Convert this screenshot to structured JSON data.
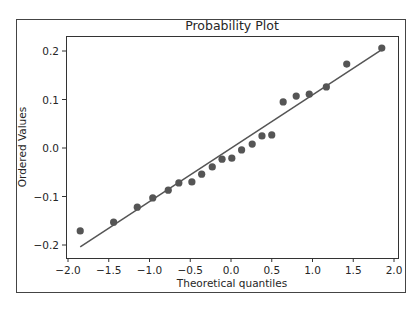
{
  "chart_data": {
    "type": "scatter",
    "title": "Probability Plot",
    "xlabel": "Theoretical quantiles",
    "ylabel": "Ordered Values",
    "xlim": [
      -2.02,
      2.05
    ],
    "ylim": [
      -0.227,
      0.231
    ],
    "grid": false,
    "legend": null,
    "x_ticks": [
      -2.0,
      -1.5,
      -1.0,
      -0.5,
      0.0,
      0.5,
      1.0,
      1.5,
      2.0
    ],
    "x_tick_labels": [
      "−2.0",
      "−1.5",
      "−1.0",
      "−0.5",
      "0.0",
      "0.5",
      "1.0",
      "1.5",
      "2.0"
    ],
    "y_ticks": [
      -0.2,
      -0.1,
      0.0,
      0.1,
      0.2
    ],
    "y_tick_labels": [
      "−0.2",
      "−0.1",
      "0.0",
      "0.1",
      "0.2"
    ],
    "series": [
      {
        "name": "ordered values",
        "kind": "scatter",
        "color": "#555555",
        "x": [
          -1.85,
          -1.44,
          -1.15,
          -0.96,
          -0.77,
          -0.64,
          -0.48,
          -0.36,
          -0.23,
          -0.11,
          0.01,
          0.13,
          0.26,
          0.38,
          0.5,
          0.64,
          0.8,
          0.96,
          1.17,
          1.42,
          1.85
        ],
        "y": [
          -0.171,
          -0.153,
          -0.122,
          -0.103,
          -0.087,
          -0.072,
          -0.07,
          -0.054,
          -0.039,
          -0.023,
          -0.021,
          -0.004,
          0.008,
          0.025,
          0.027,
          0.095,
          0.107,
          0.111,
          0.126,
          0.173,
          0.206
        ]
      },
      {
        "name": "fit line",
        "kind": "line",
        "color": "#555555",
        "x": [
          -1.85,
          1.85
        ],
        "y": [
          -0.204,
          0.203
        ]
      }
    ]
  },
  "layout": {
    "frame": {
      "left": 16,
      "top": 19,
      "right": 405,
      "bottom": 292
    },
    "plot": {
      "left": 66,
      "top": 36,
      "right": 398,
      "bottom": 258
    },
    "x_origin_px": 231,
    "x_px_per_unit": 81.5,
    "y_origin_px": 148,
    "y_px_per_unit": 485
  }
}
